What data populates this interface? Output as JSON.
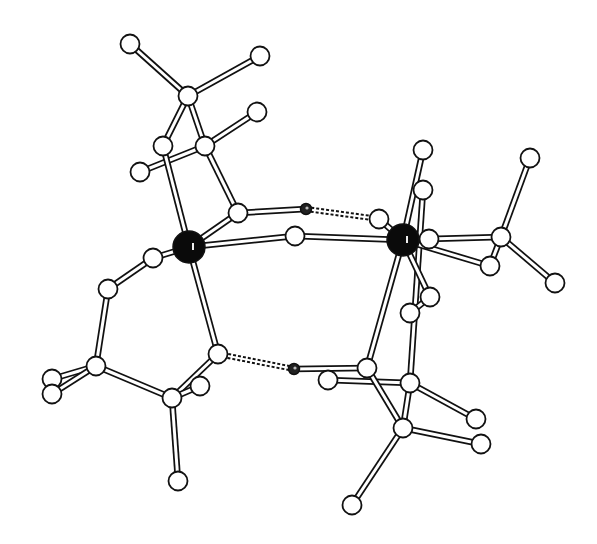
{
  "diagram": {
    "colors": {
      "background": "#ffffff",
      "line": "#111111",
      "atom_fill": "#ffffff",
      "metal_fill": "#0a0a0a"
    },
    "atoms": [
      {
        "id": "A1",
        "type": "atom"
      },
      {
        "id": "A2",
        "type": "atom"
      },
      {
        "id": "A3",
        "type": "atom"
      },
      {
        "id": "A4",
        "type": "atom"
      },
      {
        "id": "A5",
        "type": "atom"
      },
      {
        "id": "A6",
        "type": "atom"
      },
      {
        "id": "A7",
        "type": "atom"
      },
      {
        "id": "M1",
        "type": "metal"
      },
      {
        "id": "A8",
        "type": "atom"
      },
      {
        "id": "H1",
        "type": "hydrogen"
      },
      {
        "id": "A9",
        "type": "atom"
      },
      {
        "id": "A10",
        "type": "atom"
      },
      {
        "id": "A11",
        "type": "atom"
      },
      {
        "id": "M2",
        "type": "metal"
      },
      {
        "id": "A12",
        "type": "atom"
      },
      {
        "id": "A13",
        "type": "atom"
      },
      {
        "id": "A14",
        "type": "atom"
      },
      {
        "id": "A15",
        "type": "atom"
      },
      {
        "id": "A16",
        "type": "atom"
      },
      {
        "id": "A17",
        "type": "atom"
      },
      {
        "id": "A18",
        "type": "atom"
      },
      {
        "id": "A19",
        "type": "atom"
      },
      {
        "id": "A20",
        "type": "atom"
      },
      {
        "id": "A21",
        "type": "atom"
      },
      {
        "id": "A22",
        "type": "atom"
      },
      {
        "id": "A23",
        "type": "atom"
      },
      {
        "id": "A24",
        "type": "atom"
      },
      {
        "id": "A25",
        "type": "atom"
      },
      {
        "id": "H2",
        "type": "hydrogen"
      },
      {
        "id": "A26",
        "type": "atom"
      },
      {
        "id": "A27",
        "type": "atom"
      },
      {
        "id": "A28",
        "type": "atom"
      },
      {
        "id": "A29",
        "type": "atom"
      },
      {
        "id": "A30",
        "type": "atom"
      },
      {
        "id": "A31",
        "type": "atom"
      },
      {
        "id": "A32",
        "type": "atom"
      },
      {
        "id": "A33",
        "type": "atom"
      },
      {
        "id": "A34",
        "type": "atom"
      },
      {
        "id": "A35",
        "type": "atom"
      }
    ],
    "bonds": [
      [
        "A1",
        "A3",
        "single"
      ],
      [
        "A2",
        "A3",
        "single"
      ],
      [
        "A3",
        "A4",
        "single"
      ],
      [
        "A3",
        "A5",
        "single"
      ],
      [
        "A7",
        "A5",
        "single"
      ],
      [
        "A5",
        "A6",
        "single"
      ],
      [
        "A4",
        "M1",
        "single"
      ],
      [
        "A5",
        "A8",
        "single"
      ],
      [
        "A8",
        "M1",
        "single"
      ],
      [
        "A8",
        "H1",
        "single"
      ],
      [
        "H1",
        "A12",
        "hbond"
      ],
      [
        "M1",
        "A10",
        "single"
      ],
      [
        "A10",
        "M2",
        "single"
      ],
      [
        "M1",
        "A9",
        "single"
      ],
      [
        "A9",
        "A11",
        "single"
      ],
      [
        "A11",
        "A22",
        "single"
      ],
      [
        "A22",
        "A23",
        "single"
      ],
      [
        "A22",
        "A24",
        "single"
      ],
      [
        "A22",
        "A27",
        "single"
      ],
      [
        "M1",
        "A25",
        "single"
      ],
      [
        "A25",
        "A27",
        "single"
      ],
      [
        "A27",
        "A26",
        "single"
      ],
      [
        "A27",
        "A28",
        "single"
      ],
      [
        "A25",
        "H2",
        "hbond"
      ],
      [
        "H2",
        "A30",
        "single"
      ],
      [
        "A29",
        "A31",
        "single"
      ],
      [
        "A12",
        "M2",
        "single"
      ],
      [
        "M2",
        "A13",
        "single"
      ],
      [
        "M2",
        "A30",
        "single"
      ],
      [
        "A14",
        "A31",
        "single"
      ],
      [
        "M2",
        "A15",
        "single"
      ],
      [
        "A15",
        "A17",
        "single"
      ],
      [
        "M2",
        "A18",
        "single"
      ],
      [
        "A17",
        "A16",
        "single"
      ],
      [
        "A17",
        "A19",
        "single"
      ],
      [
        "A17",
        "A18",
        "single"
      ],
      [
        "M2",
        "A20",
        "single"
      ],
      [
        "A20",
        "A21",
        "single"
      ],
      [
        "A30",
        "A34",
        "single"
      ],
      [
        "A31",
        "A34",
        "single"
      ],
      [
        "A31",
        "A32",
        "single"
      ],
      [
        "A34",
        "A33",
        "single"
      ],
      [
        "A34",
        "A35",
        "single"
      ]
    ]
  }
}
